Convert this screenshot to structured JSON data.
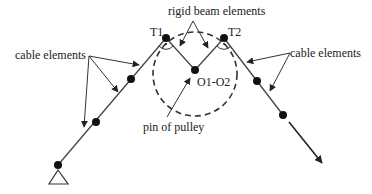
{
  "diagram": {
    "labels": {
      "rigid_beam": "rigid beam elements",
      "cable_left": "cable elements",
      "cable_right": "cable elements",
      "t1": "T1",
      "t2": "T2",
      "center": "O1-O2",
      "pin": "pin of pulley"
    },
    "colors": {
      "stroke": "#333333",
      "node": "#111111",
      "background": "#ffffff"
    }
  }
}
